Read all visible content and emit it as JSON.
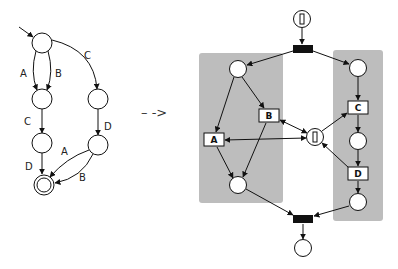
{
  "automaton": {
    "states": [
      {
        "id": "s0",
        "x": 42,
        "y": 43,
        "initial": true
      },
      {
        "id": "s1",
        "x": 42,
        "y": 99
      },
      {
        "id": "s2",
        "x": 98,
        "y": 99
      },
      {
        "id": "s3",
        "x": 42,
        "y": 143
      },
      {
        "id": "s4",
        "x": 98,
        "y": 145
      },
      {
        "id": "s5",
        "x": 44,
        "y": 185,
        "final": true
      }
    ],
    "edges": [
      {
        "from": "s0",
        "to": "s1",
        "label": "A"
      },
      {
        "from": "s0",
        "to": "s1",
        "label": "B"
      },
      {
        "from": "s0",
        "to": "s2",
        "label": "C"
      },
      {
        "from": "s1",
        "to": "s3",
        "label": "C"
      },
      {
        "from": "s2",
        "to": "s4",
        "label": "D"
      },
      {
        "from": "s3",
        "to": "s5",
        "label": "D"
      },
      {
        "from": "s4",
        "to": "s5",
        "label": "A"
      },
      {
        "from": "s4",
        "to": "s5",
        "label": "B"
      }
    ],
    "labels": {
      "s0_s1_A": "A",
      "s0_s1_B": "B",
      "s0_s2_C": "C",
      "s1_s3_C": "C",
      "s2_s4_D": "D",
      "s3_s5_D": "D",
      "s4_s5_A": "A",
      "s4_s5_B": "B"
    }
  },
  "transform_arrow": "– ->",
  "petri_net": {
    "token_symbol": "▯",
    "places": {
      "start": {
        "x": 302,
        "y": 19,
        "token": true
      },
      "left_top": {
        "x": 238,
        "y": 69
      },
      "left_bottom": {
        "x": 238,
        "y": 185
      },
      "right_top": {
        "x": 358,
        "y": 68
      },
      "right_mid": {
        "x": 358,
        "y": 141
      },
      "right_bottom": {
        "x": 358,
        "y": 202
      },
      "mutex": {
        "x": 315,
        "y": 137,
        "token": true
      },
      "end": {
        "x": 303,
        "y": 248
      }
    },
    "transitions": {
      "A": {
        "label": "A",
        "x": 214,
        "y": 140
      },
      "B": {
        "label": "B",
        "x": 269,
        "y": 116
      },
      "C": {
        "label": "C",
        "x": 358,
        "y": 108
      },
      "D": {
        "label": "D",
        "x": 358,
        "y": 174
      },
      "fork": {
        "x": 303,
        "y": 49
      },
      "join": {
        "x": 303,
        "y": 219
      }
    },
    "regions": [
      {
        "name": "left-concurrent-region",
        "x": 199,
        "y": 53,
        "w": 84,
        "h": 150,
        "color": "#bdbdbd"
      },
      {
        "name": "right-concurrent-region",
        "x": 333,
        "y": 50,
        "w": 50,
        "h": 171,
        "color": "#bdbdbd"
      }
    ]
  }
}
